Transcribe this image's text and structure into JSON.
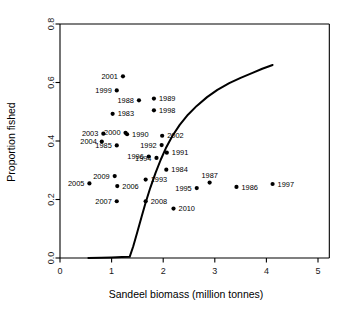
{
  "chart_data": {
    "type": "scatter",
    "title": "",
    "xlabel": "Sandeel biomass (million tonnes)",
    "ylabel": "Proportion fished",
    "xlim": [
      0,
      5.2
    ],
    "ylim": [
      0.0,
      0.82
    ],
    "xticks": [
      0,
      1,
      2,
      3,
      4,
      5
    ],
    "xticklabels": [
      "0",
      "1",
      "2",
      "3",
      "4",
      "5"
    ],
    "yticks": [
      0.0,
      0.2,
      0.4,
      0.6,
      0.8
    ],
    "yticklabels": [
      "0.0",
      "0.2",
      "0.4",
      "0.6",
      "0.8"
    ],
    "grid": false,
    "legend": "none",
    "point_color": "#000000",
    "curve_color": "#000000",
    "points": [
      {
        "label": "1983",
        "x": 1.02,
        "y": 0.493,
        "label_side": "right"
      },
      {
        "label": "1984",
        "x": 2.06,
        "y": 0.302,
        "label_side": "right"
      },
      {
        "label": "1985",
        "x": 1.1,
        "y": 0.385,
        "label_side": "left"
      },
      {
        "label": "1986",
        "x": 3.42,
        "y": 0.243,
        "label_side": "right"
      },
      {
        "label": "1987",
        "x": 2.9,
        "y": 0.258,
        "label_side": "above"
      },
      {
        "label": "1988",
        "x": 1.53,
        "y": 0.539,
        "label_side": "left"
      },
      {
        "label": "1989",
        "x": 1.82,
        "y": 0.545,
        "label_side": "right"
      },
      {
        "label": "1990",
        "x": 1.3,
        "y": 0.423,
        "label_side": "right"
      },
      {
        "label": "1991",
        "x": 2.07,
        "y": 0.36,
        "label_side": "right"
      },
      {
        "label": "1992",
        "x": 1.97,
        "y": 0.386,
        "label_side": "left"
      },
      {
        "label": "1993",
        "x": 1.66,
        "y": 0.268,
        "label_side": "right"
      },
      {
        "label": "1994",
        "x": 1.87,
        "y": 0.342,
        "label_side": "left"
      },
      {
        "label": "1995",
        "x": 2.65,
        "y": 0.239,
        "label_side": "left"
      },
      {
        "label": "1996",
        "x": 1.72,
        "y": 0.347,
        "label_side": "left"
      },
      {
        "label": "1997",
        "x": 4.12,
        "y": 0.253,
        "label_side": "right"
      },
      {
        "label": "1998",
        "x": 1.82,
        "y": 0.505,
        "label_side": "right"
      },
      {
        "label": "1999",
        "x": 1.1,
        "y": 0.573,
        "label_side": "left"
      },
      {
        "label": "2000",
        "x": 1.27,
        "y": 0.428,
        "label_side": "left"
      },
      {
        "label": "2001",
        "x": 1.22,
        "y": 0.621,
        "label_side": "left"
      },
      {
        "label": "2002",
        "x": 1.98,
        "y": 0.418,
        "label_side": "right"
      },
      {
        "label": "2003",
        "x": 0.84,
        "y": 0.425,
        "label_side": "left"
      },
      {
        "label": "2004",
        "x": 0.81,
        "y": 0.398,
        "label_side": "left"
      },
      {
        "label": "2005",
        "x": 0.57,
        "y": 0.255,
        "label_side": "left"
      },
      {
        "label": "2006",
        "x": 1.11,
        "y": 0.246,
        "label_side": "right"
      },
      {
        "label": "2007",
        "x": 1.1,
        "y": 0.194,
        "label_side": "left"
      },
      {
        "label": "2008",
        "x": 1.66,
        "y": 0.194,
        "label_side": "right"
      },
      {
        "label": "2009",
        "x": 1.06,
        "y": 0.28,
        "label_side": "left"
      },
      {
        "label": "2010",
        "x": 2.2,
        "y": 0.169,
        "label_side": "right"
      }
    ],
    "curve": {
      "name": "fitted-relationship",
      "points": [
        [
          0.55,
          0.0
        ],
        [
          0.8,
          0.001
        ],
        [
          1.0,
          0.002
        ],
        [
          1.2,
          0.003
        ],
        [
          1.35,
          0.004
        ],
        [
          1.42,
          0.04
        ],
        [
          1.5,
          0.09
        ],
        [
          1.58,
          0.14
        ],
        [
          1.66,
          0.19
        ],
        [
          1.75,
          0.24
        ],
        [
          1.85,
          0.29
        ],
        [
          1.95,
          0.335
        ],
        [
          2.05,
          0.375
        ],
        [
          2.18,
          0.418
        ],
        [
          2.32,
          0.455
        ],
        [
          2.48,
          0.49
        ],
        [
          2.65,
          0.52
        ],
        [
          2.85,
          0.55
        ],
        [
          3.05,
          0.575
        ],
        [
          3.28,
          0.598
        ],
        [
          3.5,
          0.616
        ],
        [
          3.72,
          0.632
        ],
        [
          3.92,
          0.647
        ],
        [
          4.12,
          0.66
        ]
      ]
    }
  },
  "axes": {
    "x_title": "Sandeel biomass (million tonnes)",
    "y_title": "Proportion fished"
  }
}
